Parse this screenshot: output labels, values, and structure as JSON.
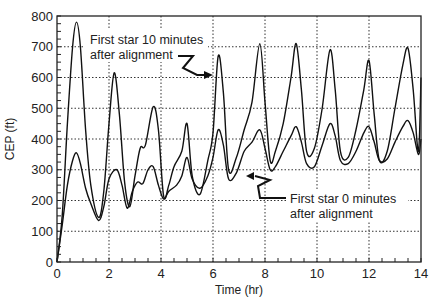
{
  "chart_data": {
    "type": "line",
    "title": "",
    "xlabel": "Time (hr)",
    "ylabel": "CEP (ft)",
    "xlim": [
      0,
      14
    ],
    "ylim": [
      0,
      800
    ],
    "xticks": [
      0,
      2,
      4,
      6,
      8,
      10,
      12,
      14
    ],
    "yticks": [
      0,
      100,
      200,
      300,
      400,
      500,
      600,
      700,
      800
    ],
    "grid": "dotted",
    "series": [
      {
        "name": "First star 10 minutes after alignment",
        "x": [
          0,
          0.2,
          0.4,
          0.6,
          0.75,
          0.9,
          1.1,
          1.3,
          1.6,
          1.8,
          2.0,
          2.2,
          2.4,
          2.6,
          2.8,
          3.0,
          3.2,
          3.4,
          3.7,
          3.9,
          4.1,
          4.3,
          4.5,
          4.8,
          5.0,
          5.2,
          5.5,
          5.8,
          6.0,
          6.2,
          6.4,
          6.6,
          6.9,
          7.2,
          7.5,
          7.8,
          8.0,
          8.2,
          8.4,
          8.7,
          9.0,
          9.2,
          9.4,
          9.6,
          9.9,
          10.2,
          10.5,
          10.7,
          10.9,
          11.2,
          11.5,
          11.8,
          12.0,
          12.2,
          12.4,
          12.7,
          13.0,
          13.3,
          13.5,
          13.7,
          13.9,
          14.0
        ],
        "values": [
          0,
          150,
          450,
          700,
          780,
          700,
          430,
          250,
          145,
          230,
          450,
          615,
          480,
          260,
          180,
          280,
          370,
          380,
          505,
          430,
          215,
          250,
          310,
          360,
          450,
          280,
          220,
          330,
          420,
          670,
          550,
          300,
          340,
          430,
          520,
          710,
          520,
          330,
          360,
          450,
          600,
          710,
          560,
          360,
          370,
          500,
          690,
          560,
          360,
          340,
          430,
          560,
          655,
          480,
          330,
          360,
          500,
          640,
          695,
          560,
          360,
          600
        ]
      },
      {
        "name": "First star 0 minutes after alignment",
        "x": [
          0,
          0.2,
          0.4,
          0.6,
          0.75,
          0.9,
          1.1,
          1.3,
          1.6,
          1.8,
          2.0,
          2.3,
          2.5,
          2.7,
          2.9,
          3.1,
          3.3,
          3.5,
          3.7,
          3.9,
          4.1,
          4.3,
          4.6,
          4.8,
          5.0,
          5.2,
          5.5,
          5.8,
          6.0,
          6.2,
          6.4,
          6.6,
          6.9,
          7.2,
          7.5,
          7.8,
          8.0,
          8.2,
          8.4,
          8.7,
          9.0,
          9.2,
          9.4,
          9.6,
          9.9,
          10.2,
          10.5,
          10.7,
          10.9,
          11.2,
          11.5,
          11.8,
          12.0,
          12.2,
          12.4,
          12.7,
          13.0,
          13.3,
          13.5,
          13.7,
          13.9,
          14.0
        ],
        "values": [
          0,
          120,
          250,
          330,
          355,
          320,
          240,
          190,
          135,
          180,
          270,
          300,
          250,
          175,
          230,
          260,
          255,
          300,
          310,
          250,
          205,
          230,
          250,
          280,
          340,
          270,
          240,
          280,
          340,
          430,
          380,
          270,
          290,
          360,
          390,
          430,
          370,
          300,
          310,
          360,
          410,
          440,
          390,
          320,
          310,
          380,
          450,
          410,
          330,
          320,
          360,
          420,
          440,
          390,
          330,
          335,
          390,
          440,
          460,
          420,
          350,
          400
        ]
      }
    ],
    "annotations": [
      {
        "line1": "First star 10 minutes",
        "line2": "after alignment",
        "target_series": 0
      },
      {
        "line1": "First star 0 minutes",
        "line2": "after alignment",
        "target_series": 1
      }
    ]
  }
}
